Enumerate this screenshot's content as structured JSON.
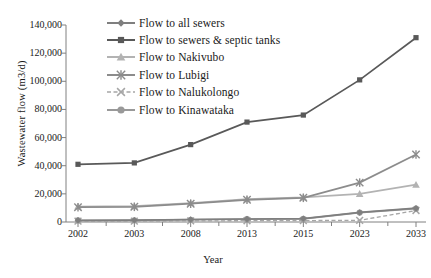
{
  "chart_data": {
    "type": "line",
    "title": "",
    "xlabel": "Year",
    "ylabel": "Wastewater flow (m3/d)",
    "categories": [
      "2002",
      "2003",
      "2008",
      "2013",
      "2015",
      "2023",
      "2033"
    ],
    "ylim": [
      0,
      140000
    ],
    "ytick_values": [
      0,
      20000,
      40000,
      60000,
      80000,
      100000,
      120000,
      140000
    ],
    "ytick_labels": [
      "0",
      "20,000",
      "40,000",
      "60,000",
      "80,000",
      "100,000",
      "120,000",
      "140,000"
    ],
    "grid": false,
    "legend_position": "top-left-inside",
    "series": [
      {
        "name": "Flow to all sewers",
        "marker": "diamond",
        "color": "#7f7f7f",
        "dash": false,
        "values": [
          1200,
          1300,
          1800,
          2100,
          2400,
          6800,
          9800
        ]
      },
      {
        "name": "Flow to sewers & septic tanks",
        "marker": "square",
        "color": "#595959",
        "dash": false,
        "values": [
          41000,
          42000,
          55000,
          71000,
          76000,
          101000,
          131000
        ]
      },
      {
        "name": "Flow to Nakivubo",
        "marker": "triangle",
        "color": "#b3b3b3",
        "dash": false,
        "values": [
          11000,
          11200,
          13500,
          16200,
          17500,
          20000,
          26500
        ]
      },
      {
        "name": "Flow to Lubigi",
        "marker": "star",
        "color": "#8c8c8c",
        "dash": false,
        "values": [
          10500,
          10800,
          13000,
          15800,
          17200,
          28000,
          48000
        ]
      },
      {
        "name": "Flow to Nalukolongo",
        "marker": "x",
        "color": "#a6a6a6",
        "dash": true,
        "values": [
          600,
          650,
          800,
          900,
          1000,
          1200,
          8200
        ]
      },
      {
        "name": "Flow to Kinawataka",
        "marker": "circle",
        "color": "#999999",
        "dash": false,
        "values": [
          1100,
          1200,
          1600,
          2000,
          2300,
          6700,
          9500
        ]
      }
    ]
  },
  "axes": {
    "x_title": "Year",
    "y_title": "Wastewater flow (m3/d)"
  }
}
